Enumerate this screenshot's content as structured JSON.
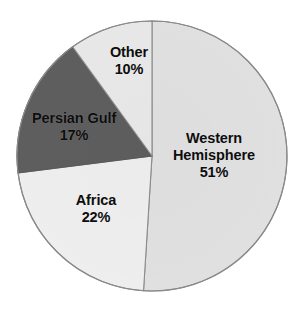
{
  "chart_data": {
    "type": "pie",
    "title": "",
    "subtitle": "",
    "xlabel": "",
    "ylabel": "",
    "legend": "none",
    "grid": false,
    "value_unit": "%",
    "start_angle_deg": 0,
    "direction": "clockwise",
    "categories": [
      "Western Hemisphere",
      "Africa",
      "Persian Gulf",
      "Other"
    ],
    "values": [
      51,
      22,
      17,
      10
    ],
    "slices": [
      {
        "label": "Western Hemisphere",
        "label_line_1": "Western",
        "label_line_2": "Hemisphere",
        "value": 51,
        "value_text": "51%",
        "color": "#e0e0e0"
      },
      {
        "label": "Africa",
        "label_line_1": "Africa",
        "label_line_2": "",
        "value": 22,
        "value_text": "22%",
        "color": "#eeeeee"
      },
      {
        "label": "Persian Gulf",
        "label_line_1": "Persian Gulf",
        "label_line_2": "",
        "value": 17,
        "value_text": "17%",
        "color": "#5e5e5e"
      },
      {
        "label": "Other",
        "label_line_1": "Other",
        "label_line_2": "",
        "value": 10,
        "value_text": "10%",
        "color": "#e8e8e8"
      }
    ]
  },
  "figure": {
    "background_color": "#ffffff",
    "outline_color": "#8a8a8a",
    "label_text_color": "#0d0d0d",
    "center_x": 152,
    "center_y": 156,
    "radius": 135
  }
}
